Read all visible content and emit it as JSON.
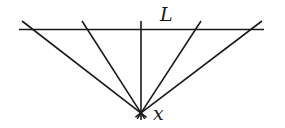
{
  "diagram": {
    "stroke_color": "#1a1a1a",
    "line_L": {
      "label": "L",
      "x1": 19,
      "y1": 29.5,
      "x2": 264,
      "y2": 29.5,
      "label_x": 160,
      "label_y": 21,
      "label_size": 19
    },
    "point_x": {
      "label": "x",
      "cx": 141,
      "cy": 113,
      "label_x": 153,
      "label_y": 120,
      "label_size": 19
    },
    "rays": [
      {
        "x1": 22,
        "y1": 21
      },
      {
        "x1": 82,
        "y1": 21
      },
      {
        "x1": 141,
        "y1": 21
      },
      {
        "x1": 201,
        "y1": 21
      },
      {
        "x1": 262,
        "y1": 21
      }
    ],
    "ray_extension_below": 7
  }
}
